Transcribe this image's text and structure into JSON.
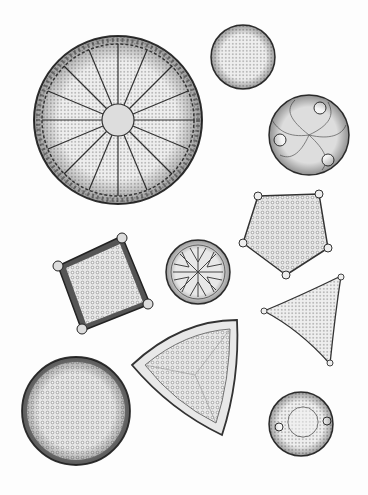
{
  "figure": {
    "kind": "scientific illustration",
    "background": "#fdfdfd",
    "ink": "#2a2a2a",
    "specimens": [
      {
        "id": "radial-disc",
        "shape": "circle",
        "cx": 118,
        "cy": 120,
        "r": 84,
        "pattern": "radial-ribs"
      },
      {
        "id": "small-dotted-disc",
        "shape": "circle",
        "cx": 243,
        "cy": 57,
        "r": 32,
        "pattern": "dots"
      },
      {
        "id": "three-ocelli-disc",
        "shape": "circle",
        "cx": 309,
        "cy": 135,
        "r": 40,
        "pattern": "swirl"
      },
      {
        "id": "pentagon",
        "shape": "pentagon",
        "cx": 285,
        "cy": 233,
        "r": 45,
        "pattern": "dots"
      },
      {
        "id": "square",
        "shape": "square",
        "cx": 102,
        "cy": 285,
        "r": 48,
        "pattern": "dots"
      },
      {
        "id": "rosette-disc",
        "shape": "circle",
        "cx": 198,
        "cy": 272,
        "r": 32,
        "pattern": "rosette"
      },
      {
        "id": "small-triangle",
        "shape": "triangle",
        "cx": 305,
        "cy": 315,
        "r": 45,
        "pattern": "dots"
      },
      {
        "id": "large-triangle",
        "shape": "triangle",
        "cx": 190,
        "cy": 375,
        "r": 58,
        "pattern": "dots"
      },
      {
        "id": "large-disc",
        "shape": "circle",
        "cx": 76,
        "cy": 411,
        "r": 54,
        "pattern": "dots"
      },
      {
        "id": "ring-disc",
        "shape": "circle",
        "cx": 301,
        "cy": 424,
        "r": 32,
        "pattern": "ring"
      }
    ]
  }
}
